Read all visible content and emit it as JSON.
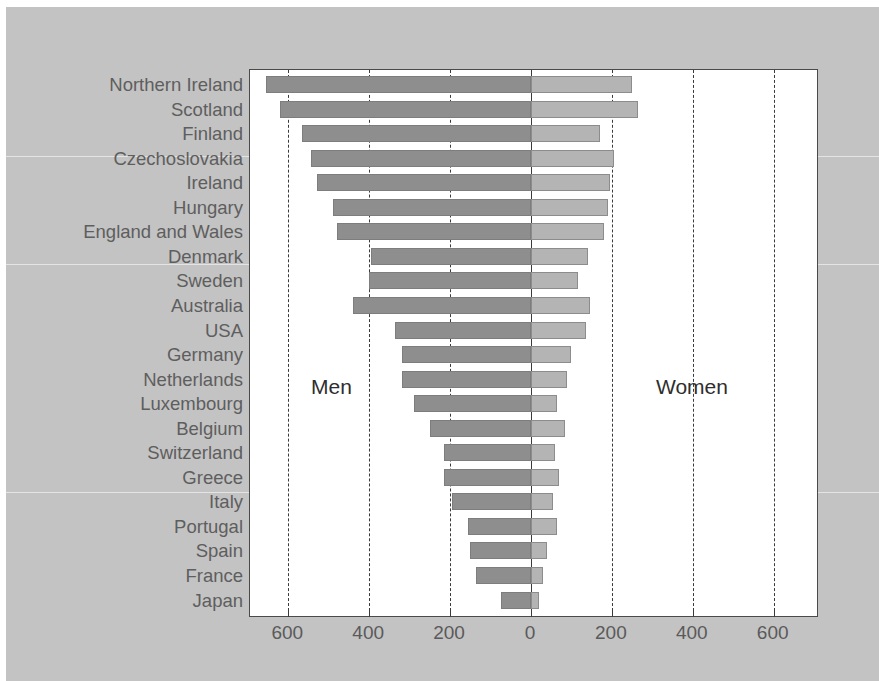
{
  "chart_data": {
    "type": "bar",
    "orientation": "horizontal",
    "subtype": "diverging-population-pyramid",
    "title": "",
    "xlabel": "",
    "ylabel": "",
    "grid": true,
    "grid_style": "dashed vertical",
    "xlim": [
      -700,
      700
    ],
    "xticks": [
      -600,
      -400,
      -200,
      0,
      200,
      400,
      600
    ],
    "xtick_labels": [
      "600",
      "400",
      "200",
      "0",
      "200",
      "400",
      "600"
    ],
    "legend_position": "inside-plot",
    "annotations": [
      {
        "text": "Men",
        "side": "left"
      },
      {
        "text": "Women",
        "side": "right"
      }
    ],
    "series": [
      {
        "name": "Men",
        "color": "#8e8e8e"
      },
      {
        "name": "Women",
        "color": "#b4b4b4"
      }
    ],
    "categories": [
      "Northern Ireland",
      "Scotland",
      "Finland",
      "Czechoslovakia",
      "Ireland",
      "Hungary",
      "England and Wales",
      "Denmark",
      "Sweden",
      "Australia",
      "USA",
      "Germany",
      "Netherlands",
      "Luxembourg",
      "Belgium",
      "Switzerland",
      "Greece",
      "Italy",
      "Portugal",
      "Spain",
      "France",
      "Japan"
    ],
    "men_values": [
      655,
      620,
      565,
      545,
      530,
      490,
      480,
      395,
      400,
      440,
      335,
      320,
      320,
      290,
      250,
      215,
      215,
      195,
      155,
      150,
      135,
      75
    ],
    "women_values": [
      250,
      265,
      170,
      205,
      195,
      190,
      180,
      140,
      115,
      145,
      135,
      100,
      90,
      65,
      85,
      60,
      70,
      55,
      65,
      40,
      30,
      20
    ]
  },
  "colors": {
    "panel_background": "#c3c3c3",
    "plot_background": "#ffffff",
    "men_bar": "#8e8e8e",
    "women_bar": "#b4b4b4",
    "axis": "#3a3a3a",
    "label_text": "#5e5e5e"
  }
}
